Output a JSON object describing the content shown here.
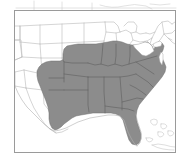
{
  "figure": {
    "kind": "distribution-range-map",
    "title": "",
    "caption": "",
    "region_name": "United States",
    "frame": {
      "x": 14,
      "y": 10,
      "width": 162,
      "height": 143,
      "border_color": "#9a9a9a"
    }
  },
  "legend": {
    "present": false,
    "entries": [
      {
        "label": "Range",
        "color": "#8c8c8c"
      },
      {
        "label": "Outside range",
        "color": "#ffffff"
      }
    ]
  },
  "colors": {
    "background": "#ffffff",
    "range_fill": "#8c8c8c",
    "range_outline": "#6f6f6f",
    "state_border": "#b9b9b9",
    "coastline": "#b0b0b0",
    "frame_border": "#9a9a9a",
    "lake_fill": "#ffffff"
  },
  "map_data": {
    "type": "choropleth-binary",
    "projection": "conic",
    "shaded_states": [
      "Texas (east)",
      "Oklahoma (east)",
      "Arkansas",
      "Louisiana",
      "Missouri",
      "Kansas (southeast)",
      "Illinois",
      "Indiana",
      "Ohio",
      "Kentucky",
      "Tennessee",
      "Mississippi",
      "Alabama",
      "Georgia",
      "Florida",
      "South Carolina",
      "North Carolina",
      "Virginia",
      "West Virginia",
      "Maryland",
      "Delaware",
      "New Jersey (south)",
      "Pennsylvania (south)"
    ],
    "unshaded_states": [
      "Washington",
      "Oregon",
      "California",
      "Idaho",
      "Nevada",
      "Utah",
      "Arizona",
      "Montana",
      "Wyoming",
      "Colorado",
      "New Mexico",
      "North Dakota",
      "South Dakota",
      "Nebraska",
      "Minnesota",
      "Iowa",
      "Wisconsin",
      "Michigan",
      "New York",
      "Vermont",
      "New Hampshire",
      "Maine",
      "Massachusetts",
      "Connecticut",
      "Rhode Island"
    ],
    "water_features": [
      "Great Lakes",
      "Gulf of Mexico",
      "Atlantic Ocean",
      "Chesapeake Bay"
    ],
    "island_features": [
      "Bahamas",
      "Cuba"
    ]
  }
}
